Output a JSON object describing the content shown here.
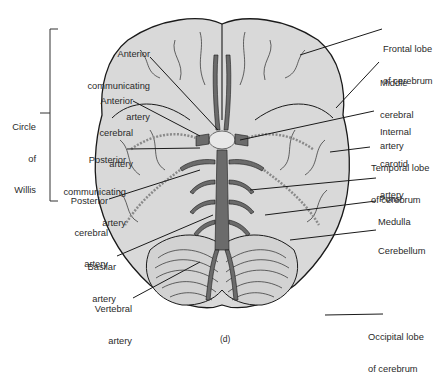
{
  "figure": {
    "panel_label": "(d)",
    "view": "Inferior view of brain showing circle of Willis",
    "colors": {
      "background": "#ffffff",
      "brain_fill": "#d9d9d9",
      "outline": "#1a1a1a",
      "artery_fill": "#6b6b6b",
      "text": "#2a2a2a"
    }
  },
  "bracket": {
    "label_line1": "Circle",
    "label_line2": "of",
    "label_line3": "Willis"
  },
  "left_labels": [
    {
      "id": "anterior-communicating-artery",
      "line1": "Anterior",
      "line2": "communicating",
      "line3": "artery"
    },
    {
      "id": "anterior-cerebral-artery",
      "line1": "Anterior",
      "line2": "cerebral",
      "line3": "artery"
    },
    {
      "id": "posterior-communicating-artery",
      "line1": "Posterior",
      "line2": "communicating",
      "line3": "artery"
    },
    {
      "id": "posterior-cerebral-artery",
      "line1": "Posterior",
      "line2": "cerebral",
      "line3": "artery"
    },
    {
      "id": "basilar-artery",
      "line1": "Basilar",
      "line2": "artery"
    },
    {
      "id": "vertebral-artery",
      "line1": "Vertebral",
      "line2": "artery"
    }
  ],
  "right_labels": [
    {
      "id": "frontal-lobe",
      "line1": "Frontal lobe",
      "line2": "of cerebrum"
    },
    {
      "id": "middle-cerebral-artery",
      "line1": "Middle",
      "line2": "cerebral",
      "line3": "artery"
    },
    {
      "id": "internal-carotid-artery",
      "line1": "Internal",
      "line2": "carotid",
      "line3": "artery"
    },
    {
      "id": "temporal-lobe",
      "line1": "Temporal lobe",
      "line2": "of cerebrum"
    },
    {
      "id": "pons",
      "line1": "Pons"
    },
    {
      "id": "medulla",
      "line1": "Medulla"
    },
    {
      "id": "cerebellum",
      "line1": "Cerebellum"
    },
    {
      "id": "occipital-lobe",
      "line1": "Occipital lobe",
      "line2": "of cerebrum"
    }
  ]
}
